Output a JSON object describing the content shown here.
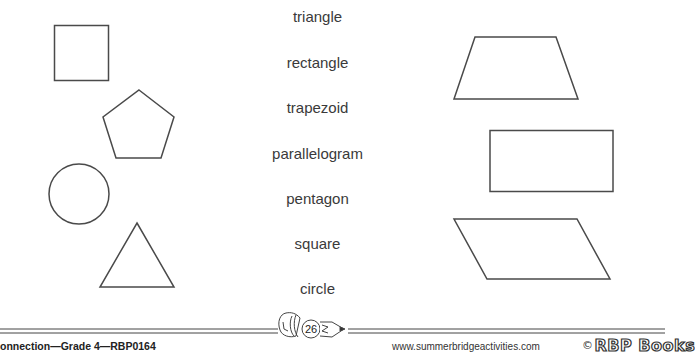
{
  "worksheet": {
    "words": [
      "triangle",
      "rectangle",
      "trapezoid",
      "parallelogram",
      "pentagon",
      "square",
      "circle"
    ],
    "left_shapes": [
      "square",
      "pentagon",
      "circle",
      "triangle"
    ],
    "right_shapes": [
      "trapezoid",
      "rectangle",
      "parallelogram"
    ]
  },
  "footer": {
    "left_text": "onnection—Grade 4—RBP0164",
    "page_number": "26",
    "url": "www.summerbridgeactivities.com",
    "copyright_symbol": "©",
    "brand": "RBP Books"
  },
  "colors": {
    "stroke": "#4a4a4a",
    "text": "#3a3a3a"
  }
}
